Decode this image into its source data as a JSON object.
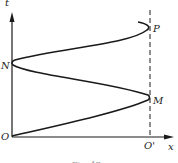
{
  "diagram": {
    "axes": {
      "y_label": "t",
      "x_label": "x",
      "origin_label": "O",
      "second_origin_label": "O'"
    },
    "points": [
      {
        "label": "N",
        "side": "left"
      },
      {
        "label": "M",
        "side": "right"
      },
      {
        "label": "P",
        "side": "right"
      }
    ],
    "caption": "Fig. 47",
    "colors": {
      "ink": "#1a1a1a",
      "background": "#ffffff"
    }
  }
}
